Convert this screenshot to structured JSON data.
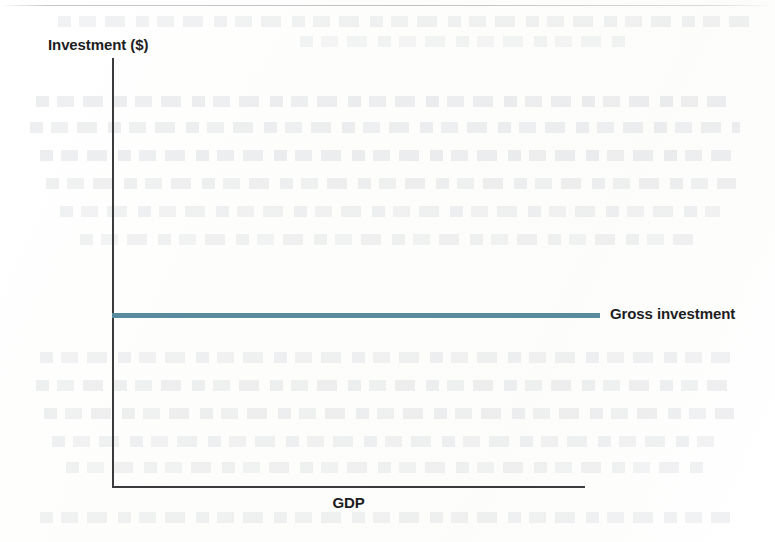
{
  "chart_data": {
    "type": "line",
    "title": "",
    "subtitle": "",
    "xlabel": "GDP",
    "ylabel": "Investment ($)",
    "grid": false,
    "legend_position": "right-inline",
    "axis_ticks": [],
    "xlim": [
      0,
      100
    ],
    "ylim": [
      0,
      100
    ],
    "series": [
      {
        "name": "Gross investment",
        "color": "#5a8a9e",
        "style": "flat-horizontal",
        "x": [
          0,
          100
        ],
        "values": [
          40,
          40
        ],
        "annotation": "Gross investment"
      }
    ],
    "annotations": [
      {
        "text": "Gross investment",
        "position": "right-end-of-line"
      }
    ]
  },
  "figure": {
    "y_axis_title": "Investment ($)",
    "x_axis_title": "GDP",
    "series_label": "Gross investment",
    "line_color": "#5a8a9e",
    "axis_color": "#3b3b3d"
  }
}
